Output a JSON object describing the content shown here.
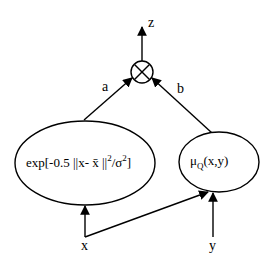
{
  "diagram": {
    "nodes": {
      "output": {
        "label": "z"
      },
      "product": {
        "symbol": "⊗",
        "meaning": "multiply"
      },
      "gaussian": {
        "text_main": "exp[-0.5 ||x- x̄ ||",
        "sup1": "2",
        "text_mid": "/σ",
        "sup2": "2",
        "text_end": "]"
      },
      "membership": {
        "mu": "μ",
        "sub": "Q",
        "args": "(x,y)"
      },
      "input_x": {
        "label": "x"
      },
      "input_y": {
        "label": "y"
      }
    },
    "edges": {
      "a": {
        "label": "a",
        "from": "gaussian",
        "to": "product"
      },
      "b": {
        "label": "b",
        "from": "membership",
        "to": "product"
      },
      "z": {
        "from": "product",
        "to": "output"
      },
      "x_to_gaussian": {
        "from": "input_x",
        "to": "gaussian"
      },
      "x_to_membership": {
        "from": "input_x",
        "to": "membership"
      },
      "y_to_membership": {
        "from": "input_y",
        "to": "membership"
      }
    }
  }
}
